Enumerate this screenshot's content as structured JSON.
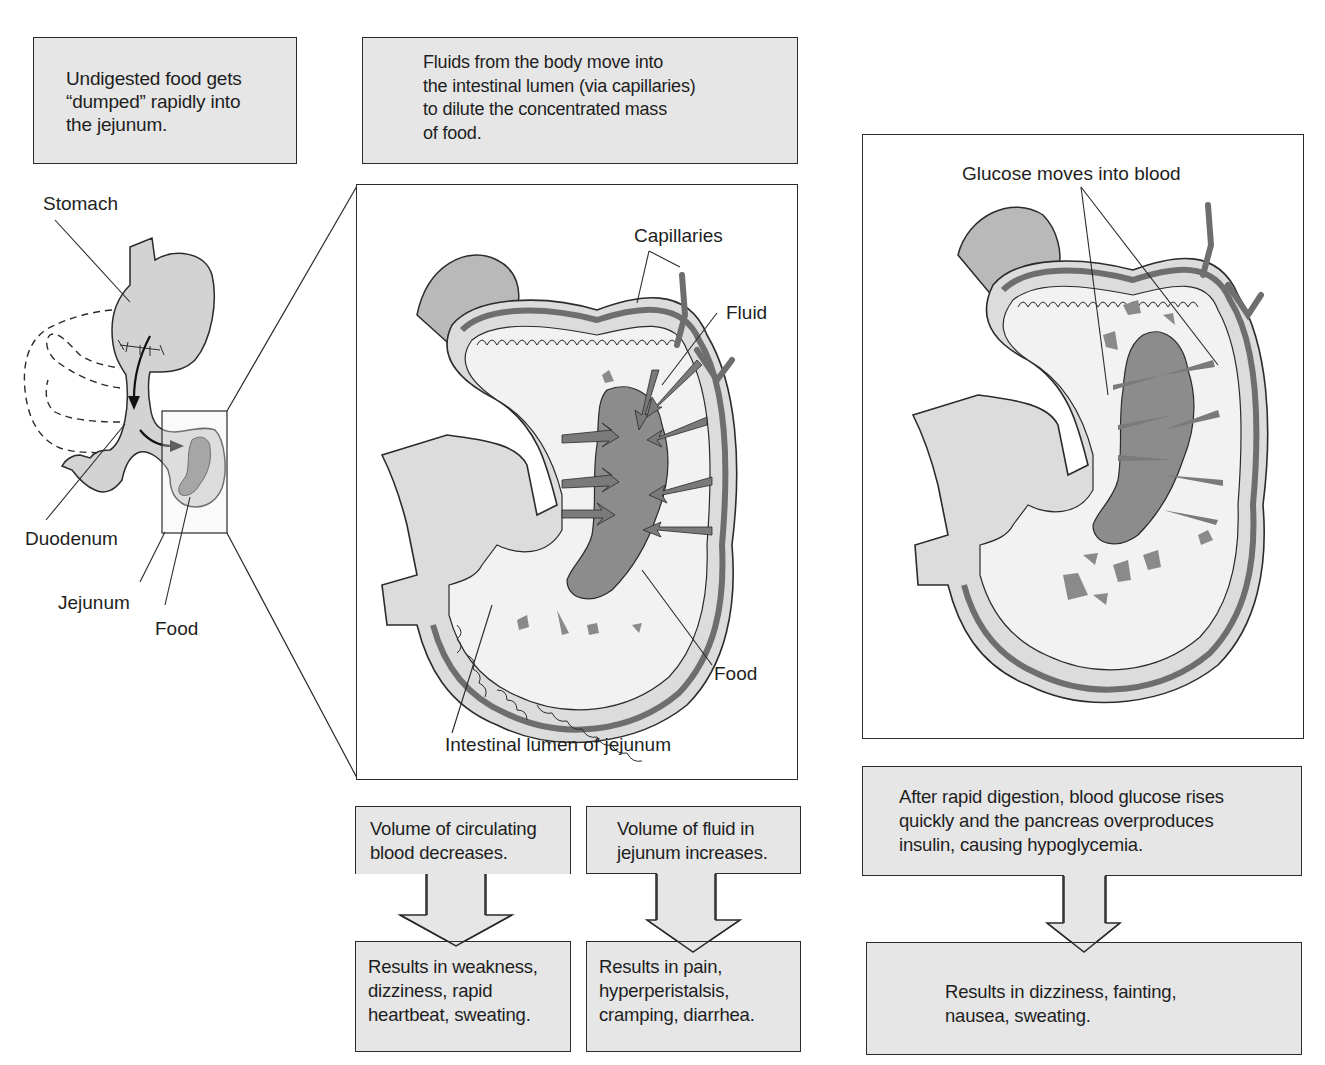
{
  "top_boxes": {
    "dumping": "Undigested food gets\n“dumped” rapidly into\nthe jejunum.",
    "fluids": "Fluids from the body move into\nthe intestinal lumen (via capillaries)\nto dilute the concentrated mass\nof food."
  },
  "overview_labels": {
    "stomach": "Stomach",
    "duodenum": "Duodenum",
    "jejunum": "Jejunum",
    "food": "Food"
  },
  "middle_panel_labels": {
    "capillaries": "Capillaries",
    "fluid": "Fluid",
    "food": "Food",
    "lumen": "Intestinal lumen of jejunum"
  },
  "right_panel_labels": {
    "glucose": "Glucose moves into blood"
  },
  "flow_left": {
    "cause": "Volume of circulating\nblood decreases.",
    "result": "Results in weakness,\ndizziness, rapid\nheartbeat, sweating."
  },
  "flow_middle": {
    "cause": "Volume of fluid in\njejunum increases.",
    "result": "Results in pain,\nhyperperistalsis,\ncramping, diarrhea."
  },
  "flow_right": {
    "cause": "After rapid digestion, blood glucose rises\nquickly and the pancreas overproduces\ninsulin, causing hypoglycemia.",
    "result": "Results in dizziness, fainting,\nnausea, sweating."
  },
  "colors": {
    "box_fill": "#e6e6e6",
    "tissue_light": "#cfcfcf",
    "tissue_dark": "#7a7a7a",
    "food_mass": "#8c8c8c",
    "outline": "#2b2b2b"
  }
}
